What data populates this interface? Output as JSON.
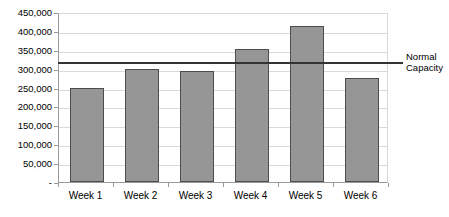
{
  "chart_data": {
    "type": "bar",
    "title": "",
    "xlabel": "",
    "ylabel": "",
    "categories": [
      "Week 1",
      "Week 2",
      "Week 3",
      "Week 4",
      "Week 5",
      "Week 6"
    ],
    "values": [
      248000,
      300000,
      293000,
      352000,
      412000,
      275000
    ],
    "series": [
      {
        "name": "",
        "values": [
          248000,
          300000,
          293000,
          352000,
          412000,
          275000
        ]
      }
    ],
    "ylim": [
      0,
      450000
    ],
    "ytick_values": [
      0,
      50000,
      100000,
      150000,
      200000,
      250000,
      300000,
      350000,
      400000,
      450000
    ],
    "ytick_labels": [
      "-",
      "50,000",
      "100,000",
      "150,000",
      "200,000",
      "250,000",
      "300,000",
      "350,000",
      "400,000",
      "450,000"
    ],
    "grid": true,
    "legend": "none",
    "annotations": [
      {
        "name": "normal-capacity",
        "label_line1": "Normal",
        "label_line2": "Capacity",
        "value": 320000,
        "type": "horizontal-line"
      }
    ],
    "colors": {
      "bar_fill": "#969696",
      "bar_border": "#4d4d4d",
      "gridline": "#d9d9d9",
      "axis": "#9a9a9a",
      "threshold_line": "#333333",
      "text": "#000000",
      "background": "#ffffff"
    }
  }
}
